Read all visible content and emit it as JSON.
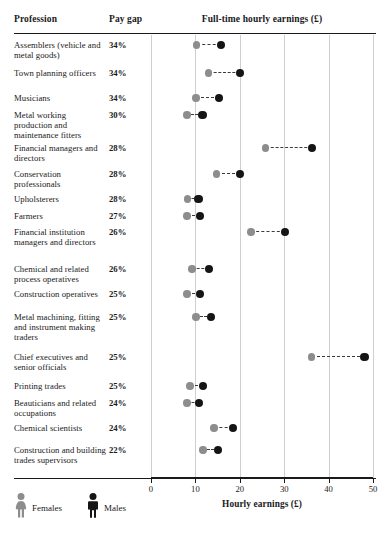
{
  "header": {
    "col_profession": "Profession",
    "col_paygap": "Pay gap",
    "col_plot": "Full-time hourly earnings (£)"
  },
  "axis": {
    "title": "Hourly earnings (£)",
    "ticks": [
      "0",
      "10",
      "20",
      "30",
      "40",
      "50"
    ],
    "min": 0,
    "max": 50
  },
  "legend": {
    "female_label": "Females",
    "male_label": "Males",
    "female_icon": "female-figure-icon",
    "male_icon": "male-figure-icon",
    "female_color": "#8d8d8d",
    "male_color": "#151515"
  },
  "chart_data": {
    "type": "scatter",
    "title": "Full-time hourly earnings (£)",
    "subtitle": "",
    "xlabel": "Hourly earnings (£)",
    "ylabel": "Profession",
    "xlim": [
      0,
      50
    ],
    "xticks": [
      0,
      10,
      20,
      30,
      40,
      50
    ],
    "grid": true,
    "legend_position": "bottom-left",
    "categories": [
      "Assemblers (vehicle and metal goods)",
      "Town planning officers",
      "Musicians",
      "Metal working production and maintenance fitters",
      "Financial managers and directors",
      "Conservation professionals",
      "Upholsterers",
      "Farmers",
      "Financial institution managers and directors",
      "Chemical and related process operatives",
      "Construction operatives",
      "Metal machining, fitting and instrument making traders",
      "Chief executives and senior officials",
      "Printing trades",
      "Beauticians and related occupations",
      "Chemical scientists",
      "Construction and building trades supervisors"
    ],
    "series": [
      {
        "name": "Females",
        "color": "#8d8d8d",
        "values": [
          10.3,
          13.0,
          10.1,
          8.1,
          25.8,
          14.8,
          8.2,
          8.1,
          22.5,
          9.2,
          8.1,
          10.1,
          36.2,
          8.8,
          8.1,
          14.2,
          11.7
        ]
      },
      {
        "name": "Males",
        "color": "#151515",
        "values": [
          15.7,
          20.0,
          15.3,
          11.6,
          36.2,
          20.0,
          10.7,
          11.0,
          30.1,
          13.0,
          11.0,
          13.5,
          48.1,
          11.7,
          10.8,
          18.4,
          15.1
        ]
      }
    ],
    "rows": [
      {
        "profession": "Assemblers (vehicle and metal goods)",
        "pay_gap": "34%",
        "female": 10.3,
        "male": 15.7
      },
      {
        "profession": "Town planning officers",
        "pay_gap": "34%",
        "female": 13.0,
        "male": 20.0
      },
      {
        "profession": "Musicians",
        "pay_gap": "34%",
        "female": 10.1,
        "male": 15.3
      },
      {
        "profession": "Metal working production and maintenance fitters",
        "pay_gap": "30%",
        "female": 8.1,
        "male": 11.6
      },
      {
        "profession": "Financial managers and directors",
        "pay_gap": "28%",
        "female": 25.8,
        "male": 36.2
      },
      {
        "profession": "Conservation professionals",
        "pay_gap": "28%",
        "female": 14.8,
        "male": 20.0
      },
      {
        "profession": "Upholsterers",
        "pay_gap": "28%",
        "female": 8.2,
        "male": 10.7
      },
      {
        "profession": "Farmers",
        "pay_gap": "27%",
        "female": 8.1,
        "male": 11.0
      },
      {
        "profession": "Financial institution managers and directors",
        "pay_gap": "26%",
        "female": 22.5,
        "male": 30.1
      },
      {
        "profession": "Chemical and related process operatives",
        "pay_gap": "26%",
        "female": 9.2,
        "male": 13.0
      },
      {
        "profession": "Construction operatives",
        "pay_gap": "25%",
        "female": 8.1,
        "male": 11.0
      },
      {
        "profession": "Metal machining, fitting and instrument making traders",
        "pay_gap": "25%",
        "female": 10.1,
        "male": 13.5
      },
      {
        "profession": "Chief executives and senior officials",
        "pay_gap": "25%",
        "female": 36.2,
        "male": 48.1
      },
      {
        "profession": "Printing trades",
        "pay_gap": "25%",
        "female": 8.8,
        "male": 11.7
      },
      {
        "profession": "Beauticians and related occupations",
        "pay_gap": "24%",
        "female": 8.1,
        "male": 10.8
      },
      {
        "profession": "Chemical scientists",
        "pay_gap": "24%",
        "female": 14.2,
        "male": 18.4
      },
      {
        "profession": "Construction and building trades supervisors",
        "pay_gap": "22%",
        "female": 11.7,
        "male": 15.1
      }
    ]
  },
  "layout": {
    "row_tops": [
      40,
      68,
      93,
      110,
      143,
      169,
      194,
      211,
      227,
      264,
      289,
      312,
      352,
      381,
      398,
      423,
      445
    ],
    "row_label_lines": [
      2,
      2,
      1,
      3,
      2,
      2,
      1,
      1,
      3,
      2,
      2,
      4,
      2,
      1,
      2,
      1,
      3
    ]
  }
}
